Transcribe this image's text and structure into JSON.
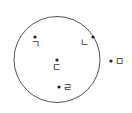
{
  "diagram": {
    "type": "circle-with-points",
    "circle": {
      "cx": 57,
      "cy": 59.5,
      "r": 43,
      "stroke": "#555555"
    },
    "points": [
      {
        "id": "g",
        "label": "ㄱ",
        "x": 35,
        "y": 37,
        "label_x": 31,
        "label_y": 48,
        "position": "inside"
      },
      {
        "id": "n",
        "label": "ㄴ",
        "x": 93,
        "y": 37,
        "label_x": 80,
        "label_y": 46,
        "position": "on-circle"
      },
      {
        "id": "d",
        "label": "ㄷ",
        "x": 57,
        "y": 60,
        "label_x": 52,
        "label_y": 71,
        "position": "center"
      },
      {
        "id": "r",
        "label": "ㄹ",
        "x": 59,
        "y": 87,
        "label_x": 63,
        "label_y": 91,
        "position": "inside"
      },
      {
        "id": "m",
        "label": "ㅁ",
        "x": 111,
        "y": 61,
        "label_x": 115,
        "label_y": 65,
        "position": "outside"
      }
    ],
    "dot_color": "#222222"
  }
}
